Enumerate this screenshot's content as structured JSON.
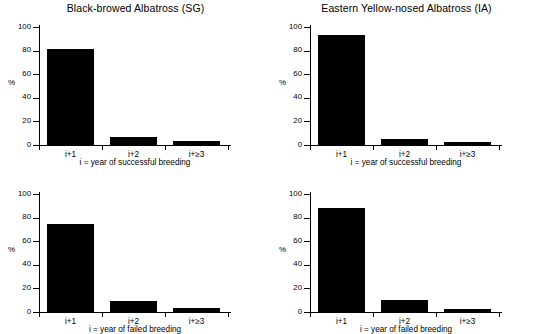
{
  "figure": {
    "width": 542,
    "height": 334,
    "background": "#ffffff",
    "bar_color": "#000000",
    "axis_color": "#000000"
  },
  "chart_data": [
    {
      "type": "bar",
      "panel_position": "top-left",
      "title": "Black-browed Albatross (SG)",
      "categories": [
        "i+1",
        "i+2",
        "i+≥3"
      ],
      "values": [
        81.5,
        7.0,
        3.5
      ],
      "xlabel": "i = year of successful breeding",
      "ylabel": "%",
      "ylim": [
        0,
        100
      ],
      "yticks": [
        0,
        20,
        40,
        60,
        80,
        100
      ],
      "ytick_labels": [
        "0",
        "20",
        "40",
        "60",
        "80",
        "100"
      ],
      "grid": false,
      "legend": false
    },
    {
      "type": "bar",
      "panel_position": "top-right",
      "title": "Eastern Yellow-nosed Albatross (IA)",
      "categories": [
        "i+1",
        "i+2",
        "i+≥3"
      ],
      "values": [
        93.0,
        5.5,
        2.5
      ],
      "xlabel": "i = year of successful breeding",
      "ylabel": "%",
      "ylim": [
        0,
        100
      ],
      "yticks": [
        0,
        20,
        40,
        60,
        80,
        100
      ],
      "ytick_labels": [
        "0",
        "20",
        "40",
        "60",
        "80",
        "100"
      ],
      "grid": false,
      "legend": false
    },
    {
      "type": "bar",
      "panel_position": "bottom-left",
      "title": "",
      "categories": [
        "i+1",
        "i+2",
        "i+≥3"
      ],
      "values": [
        75.0,
        9.5,
        3.5
      ],
      "xlabel": "i = year of failed breeding",
      "ylabel": "%",
      "ylim": [
        0,
        100
      ],
      "yticks": [
        0,
        20,
        40,
        60,
        80,
        100
      ],
      "ytick_labels": [
        "0",
        "20",
        "40",
        "60",
        "80",
        "100"
      ],
      "grid": false,
      "legend": false
    },
    {
      "type": "bar",
      "panel_position": "bottom-right",
      "title": "",
      "categories": [
        "i+1",
        "i+2",
        "i+≥3"
      ],
      "values": [
        88.0,
        10.5,
        2.5
      ],
      "xlabel": "i = year of failed breeding",
      "ylabel": "%",
      "ylim": [
        0,
        100
      ],
      "yticks": [
        0,
        20,
        40,
        60,
        80,
        100
      ],
      "ytick_labels": [
        "0",
        "20",
        "40",
        "60",
        "80",
        "100"
      ],
      "grid": false,
      "legend": false
    }
  ]
}
